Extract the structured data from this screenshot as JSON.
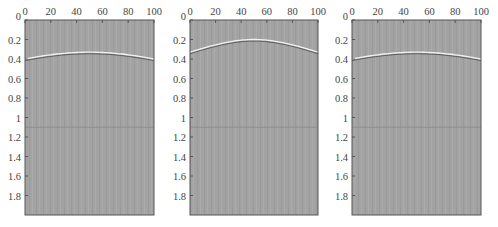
{
  "figure": {
    "background": "#ffffff",
    "panel_fill": "#a3a3a3",
    "stripe_color": "#9a9a9a",
    "frame_color": "#555555",
    "event_bright": "#f2f2f2",
    "event_dark": "#5a5a5a"
  },
  "chart_data": [
    {
      "type": "heatmap",
      "title": "",
      "xlabel": "",
      "ylabel": "",
      "x_ticks": [
        "0",
        "20",
        "40",
        "60",
        "80",
        "100"
      ],
      "y_ticks": [
        "0",
        "0.2",
        "0.4",
        "0.6",
        "0.8",
        "1",
        "1.2",
        "1.4",
        "1.6",
        "1.8"
      ],
      "xlim": [
        0,
        100
      ],
      "ylim": [
        2.0,
        0
      ],
      "x_axis_position": "top",
      "grid": false,
      "legend": null,
      "events": [
        {
          "name": "hyperbola",
          "apex_x": 50,
          "apex_t": 0.33,
          "edge_t": 0.4
        }
      ],
      "flat_reflector_t": 1.1
    },
    {
      "type": "heatmap",
      "title": "",
      "xlabel": "",
      "ylabel": "",
      "x_ticks": [
        "0",
        "20",
        "40",
        "60",
        "80",
        "100"
      ],
      "y_ticks": [
        "0",
        "0.2",
        "0.4",
        "0.6",
        "0.8",
        "1",
        "1.2",
        "1.4",
        "1.6",
        "1.8"
      ],
      "xlim": [
        0,
        100
      ],
      "ylim": [
        2.0,
        0
      ],
      "x_axis_position": "top",
      "grid": false,
      "legend": null,
      "events": [
        {
          "name": "hyperbola",
          "apex_x": 50,
          "apex_t": 0.2,
          "edge_t": 0.33
        }
      ],
      "flat_reflector_t": 1.1
    },
    {
      "type": "heatmap",
      "title": "",
      "xlabel": "",
      "ylabel": "",
      "x_ticks": [
        "0",
        "20",
        "40",
        "60",
        "80",
        "100"
      ],
      "y_ticks": [
        "0",
        "0.2",
        "0.4",
        "0.6",
        "0.8",
        "1",
        "1.2",
        "1.4",
        "1.6",
        "1.8"
      ],
      "xlim": [
        0,
        100
      ],
      "ylim": [
        2.0,
        0
      ],
      "x_axis_position": "top",
      "grid": false,
      "legend": null,
      "events": [
        {
          "name": "hyperbola",
          "apex_x": 50,
          "apex_t": 0.33,
          "edge_t": 0.4
        }
      ],
      "flat_reflector_t": 1.1
    }
  ],
  "layout": {
    "panels": [
      {
        "left": 25,
        "right": 154
      },
      {
        "left": 190,
        "right": 318
      },
      {
        "left": 352,
        "right": 481
      }
    ],
    "top": 20,
    "bottom": 215
  }
}
